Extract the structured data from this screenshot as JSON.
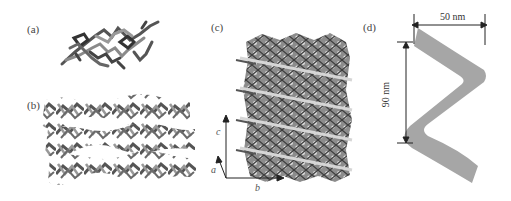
{
  "figure": {
    "panels": [
      {
        "id": "a",
        "label": "(a)",
        "description": "single molecule ball-and-stick structure"
      },
      {
        "id": "b",
        "label": "(b)",
        "description": "layered crystal packing, three zig-zag rows"
      },
      {
        "id": "c",
        "label": "(c)",
        "description": "3D crystal packing viewed along a axis",
        "axes": {
          "a": "a",
          "b": "b",
          "c": "c"
        }
      },
      {
        "id": "d",
        "label": "(d)",
        "description": "helical ribbon schematic",
        "dimensions": {
          "width": "50 nm",
          "pitch": "90 nm"
        }
      }
    ]
  },
  "colors": {
    "molecule_dark": "#3a3a3a",
    "molecule_mid": "#7a7a7a",
    "molecule_light": "#b5b5b5",
    "helix": "#a6a6a6",
    "line": "#222222"
  }
}
